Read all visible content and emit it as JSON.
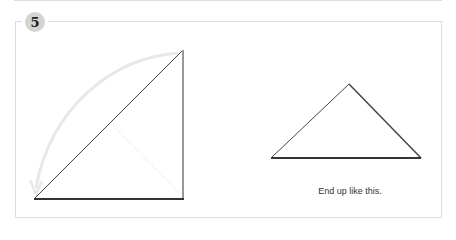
{
  "step": {
    "number": "5"
  },
  "figures": {
    "left": {
      "description": "square folded diagonally with curved fold arrow"
    },
    "right": {
      "description": "resulting triangle"
    }
  },
  "caption": "End up like this.",
  "colors": {
    "badge": "#d4d4d4",
    "arrow": "#e6e6e6",
    "line": "#333333",
    "border": "#dedede"
  }
}
